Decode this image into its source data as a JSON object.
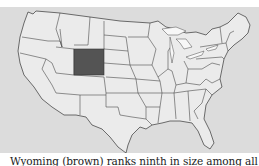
{
  "map": {
    "title": "United States map",
    "highlighted_state": "Wyoming",
    "colors": {
      "background": "#dcdcdc",
      "land": "#ebebeb",
      "borders": "#4a4a4a",
      "highlight": "#545454",
      "lakes": "#f7f7f7"
    }
  },
  "caption": {
    "text": "Wyoming (brown) ranks ninth in size among all the states and"
  }
}
